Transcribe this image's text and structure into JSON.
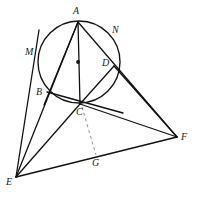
{
  "figure": {
    "width": 197,
    "height": 200,
    "background_color": "#ffffff",
    "stroke_color": "#111111",
    "dashed_stroke_color": "#8a8a8a"
  },
  "circle": {
    "center_label": "center-dot",
    "cx": 79,
    "cy": 62,
    "r": 41,
    "stroke_width": 1.3
  },
  "points": [
    {
      "id": "A",
      "label": "A",
      "x": 78,
      "y": 22,
      "label_x": 73,
      "label_y": 6
    },
    {
      "id": "N",
      "label": "N",
      "x": 113,
      "y": 40,
      "label_x": 112,
      "label_y": 25
    },
    {
      "id": "M",
      "label": "M",
      "x": 41,
      "y": 46,
      "label_x": 25,
      "label_y": 47
    },
    {
      "id": "D",
      "label": "D",
      "x": 114,
      "y": 66,
      "label_x": 102,
      "label_y": 58
    },
    {
      "id": "B",
      "label": "B",
      "x": 47,
      "y": 92,
      "label_x": 36,
      "label_y": 87
    },
    {
      "id": "C",
      "label": "C",
      "x": 80,
      "y": 104,
      "label_x": 76,
      "label_y": 107
    },
    {
      "id": "F",
      "label": "F",
      "x": 177,
      "y": 137,
      "label_x": 181,
      "label_y": 132
    },
    {
      "id": "G",
      "label": "G",
      "x": 96,
      "y": 156,
      "label_x": 92,
      "label_y": 158
    },
    {
      "id": "E",
      "label": "E",
      "x": 16,
      "y": 177,
      "label_x": 6,
      "label_y": 177
    }
  ],
  "solid_segments": [
    {
      "name": "segment-A-B",
      "from": "A",
      "to": "B"
    },
    {
      "name": "segment-A-C",
      "from": "A",
      "to": "C"
    },
    {
      "name": "segment-A-F",
      "from": "A",
      "to": "F"
    },
    {
      "name": "segment-B-C",
      "from": "B",
      "to": "C"
    },
    {
      "name": "segment-C-D",
      "from": "C",
      "to": "D"
    },
    {
      "name": "segment-D-F",
      "from": "D",
      "to": "F"
    },
    {
      "name": "segment-C-F",
      "from": "C",
      "to": "F"
    },
    {
      "name": "segment-E-M",
      "from": "E",
      "to": "M"
    },
    {
      "name": "segment-E-A",
      "from": "E",
      "to": "A"
    },
    {
      "name": "segment-E-C",
      "from": "E",
      "to": "C"
    },
    {
      "name": "segment-E-F",
      "from": "E",
      "to": "F"
    }
  ],
  "dashed_segments": [
    {
      "name": "segment-C-G",
      "from": "C",
      "to": "G"
    }
  ],
  "labels_order": [
    "A",
    "N",
    "M",
    "D",
    "B",
    "C",
    "F",
    "G",
    "E"
  ]
}
